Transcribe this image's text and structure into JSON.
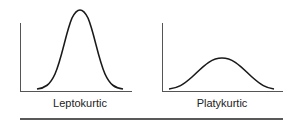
{
  "figure": {
    "panels": [
      {
        "label": "Leptokurtic",
        "shape": "tall-narrow-peak"
      },
      {
        "label": "Platykurtic",
        "shape": "low-flat-peak"
      }
    ],
    "colors": {
      "line": "#1a1a1a",
      "axis": "#555555",
      "rule": "#222222"
    }
  }
}
